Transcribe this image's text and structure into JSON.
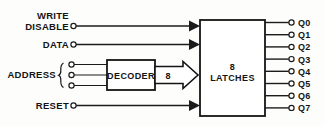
{
  "diagram": {
    "colors": {
      "line": "#1b1b1b",
      "text": "#141414",
      "background": "#fdfdfc",
      "box_fill": "#ffffff"
    },
    "inputs": [
      {
        "id": "write-disable",
        "label_line1": "WRITE",
        "label_line2": "DISABLE",
        "terminal": true,
        "arrow": true
      },
      {
        "id": "data",
        "label_line1": "DATA",
        "label_line2": "",
        "terminal": true,
        "arrow": true
      },
      {
        "id": "reset",
        "label_line1": "RESET",
        "label_line2": "",
        "terminal": true,
        "arrow": true
      }
    ],
    "address": {
      "label": "ADDRESS",
      "brace": "{",
      "line_count": 3,
      "terminals": 3
    },
    "blocks": [
      {
        "id": "decoder",
        "label": "DECODER"
      },
      {
        "id": "latches",
        "label_line1": "8",
        "label_line2": "LATCHES"
      }
    ],
    "bus": {
      "label": "8",
      "style": "hollow-block-arrow",
      "from": "decoder",
      "to": "latches"
    },
    "outputs": {
      "count": 8,
      "labels": [
        "Q0",
        "Q1",
        "Q2",
        "Q3",
        "Q4",
        "Q5",
        "Q6",
        "Q7"
      ]
    }
  }
}
